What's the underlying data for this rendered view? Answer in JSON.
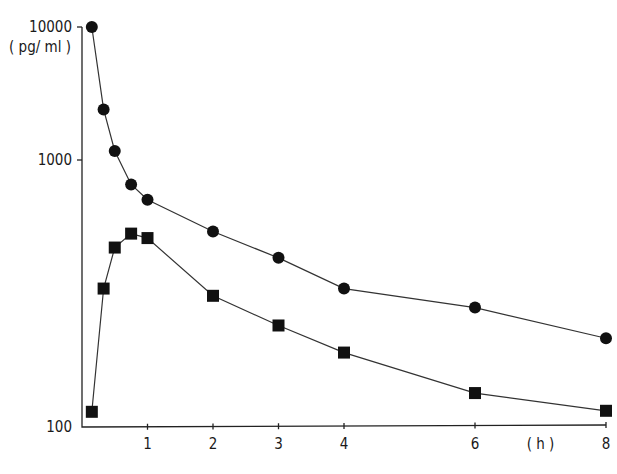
{
  "chart_data": {
    "type": "line",
    "title": "",
    "xlabel": "(h)",
    "ylabel": "(pg/ml)",
    "yscale": "log",
    "ylim": [
      100,
      10000
    ],
    "xlim": [
      0,
      8
    ],
    "grid": false,
    "legend": null,
    "x_ticks": [
      1,
      2,
      3,
      4,
      6,
      8
    ],
    "x_tick_labels": [
      "1",
      "2",
      "3",
      "4",
      "6",
      "8"
    ],
    "y_ticks": [
      100,
      1000,
      10000
    ],
    "y_tick_labels": [
      "100",
      "1000",
      "10000"
    ],
    "series": [
      {
        "name": "circles",
        "marker": "circle",
        "x": [
          0.15,
          0.33,
          0.5,
          0.75,
          1,
          2,
          3,
          4,
          6,
          8
        ],
        "values": [
          10000,
          2400,
          1170,
          810,
          710,
          540,
          430,
          330,
          280,
          215
        ]
      },
      {
        "name": "squares",
        "marker": "square",
        "x": [
          0.15,
          0.33,
          0.5,
          0.75,
          1,
          2,
          3,
          4,
          6,
          8
        ],
        "values": [
          114,
          330,
          470,
          530,
          510,
          310,
          240,
          190,
          134,
          115
        ]
      }
    ]
  }
}
